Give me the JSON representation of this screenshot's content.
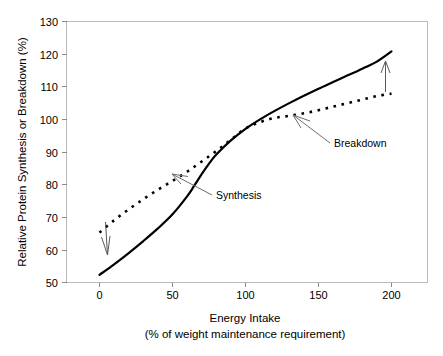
{
  "chart_data": {
    "type": "line",
    "title": "",
    "xlabel": "Energy Intake",
    "xlabel_sub": "(% of weight maintenance requirement)",
    "ylabel": "Relative Protein Synthesis or Breakdown (%)",
    "xlim": [
      -12,
      212
    ],
    "ylim": [
      50,
      130
    ],
    "xticks": [
      0,
      50,
      100,
      150,
      200
    ],
    "xtick_labels": [
      "0",
      "50",
      "100",
      "150",
      "200"
    ],
    "yticks": [
      50,
      60,
      70,
      80,
      90,
      100,
      110,
      120,
      130
    ],
    "ytick_labels": [
      "50",
      "60",
      "70",
      "80",
      "90",
      "100",
      "110",
      "120",
      "130"
    ],
    "grid": false,
    "legend": "none",
    "series": [
      {
        "name": "Synthesis",
        "style": "solid",
        "color": "#000000",
        "x": [
          0,
          10,
          20,
          30,
          40,
          50,
          60,
          65,
          70,
          75,
          80,
          90,
          100,
          110,
          120,
          130,
          140,
          150,
          160,
          170,
          180,
          190,
          200
        ],
        "y": [
          58.0,
          61.0,
          64.2,
          67.6,
          71.2,
          75.2,
          80.3,
          83.4,
          86.6,
          89.6,
          92.2,
          96.2,
          99.5,
          102.2,
          104.6,
          106.8,
          108.9,
          110.9,
          112.8,
          114.7,
          116.6,
          118.6,
          121.5
        ]
      },
      {
        "name": "Breakdown",
        "style": "dotted",
        "color": "#000000",
        "x": [
          0,
          10,
          20,
          30,
          40,
          50,
          60,
          70,
          80,
          90,
          100,
          110,
          120,
          130,
          140,
          150,
          160,
          170,
          180,
          190,
          200
        ],
        "y": [
          70.0,
          73.5,
          76.6,
          79.5,
          82.2,
          84.7,
          87.3,
          90.2,
          93.2,
          96.4,
          99.6,
          101.4,
          102.6,
          103.2,
          103.9,
          104.8,
          105.8,
          106.8,
          107.8,
          108.8,
          109.5
        ]
      }
    ],
    "annotations": [
      {
        "name": "synthesis-annotation",
        "text": "Synthesis",
        "points_to_series": "Synthesis",
        "anchor_x": 68,
        "anchor_y": 85.5,
        "label_x": 112,
        "label_y": 77.5
      },
      {
        "name": "breakdown-annotation",
        "text": "Breakdown",
        "points_to_series": "Breakdown",
        "anchor_x": 133,
        "anchor_y": 103.4,
        "label_x": 162,
        "label_y": 96.5
      },
      {
        "name": "decrease-arrow",
        "text": "",
        "direction": "down",
        "x": 5,
        "y_from": 69.5,
        "y_to": 60.0
      },
      {
        "name": "increase-arrow",
        "text": "",
        "direction": "up",
        "x": 195,
        "y_from": 108.8,
        "y_to": 118.0
      }
    ]
  },
  "axes": {
    "y_title": "Relative Protein Synthesis or Breakdown (%)",
    "x_title_line1": "Energy Intake",
    "x_title_line2": "(% of weight maintenance requirement)"
  },
  "labels": {
    "y_130": "130",
    "y_120": "120",
    "y_110": "110",
    "y_100": "100",
    "y_90": "90",
    "y_80": "80",
    "y_70": "70",
    "y_60": "60",
    "y_50": "50",
    "x_0": "0",
    "x_50": "50",
    "x_100": "100",
    "x_150": "150",
    "x_200": "200",
    "synthesis": "Synthesis",
    "breakdown": "Breakdown"
  },
  "colors": {
    "series_line": "#000000",
    "frame": "#b9b9b9",
    "annotation": "#6e6e6e",
    "background": "#ffffff"
  }
}
